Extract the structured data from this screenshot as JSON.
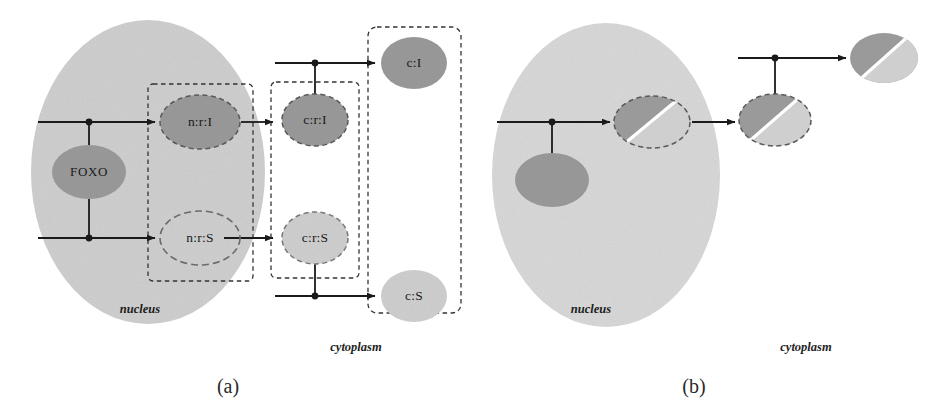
{
  "figure": {
    "panels": [
      {
        "id": "a",
        "caption": "(a)",
        "caption_x": 228,
        "caption_y": 388,
        "compartments": [
          {
            "name": "nucleus",
            "label": "nucleus",
            "label_x": 140,
            "label_y": 310,
            "shape": "ellipse",
            "cx": 148,
            "cy": 172,
            "rx": 117,
            "ry": 152,
            "fill": "#cfcfcf"
          },
          {
            "name": "cytoplasm",
            "label": "cytoplasm",
            "label_x": 356,
            "label_y": 348
          }
        ],
        "groups": [
          {
            "name": "nuclear-receptor-group",
            "x": 148,
            "y": 84,
            "w": 105,
            "h": 197
          },
          {
            "name": "cytoplasmic-receptor-group",
            "x": 271,
            "y": 82,
            "w": 88,
            "h": 196
          },
          {
            "name": "free-ligand-group",
            "x": 368,
            "y": 27,
            "w": 93,
            "h": 286
          }
        ],
        "nodes": [
          {
            "name": "foxo",
            "label": "FOXO",
            "cx": 89,
            "cy": 172,
            "rx": 37,
            "ry": 27,
            "fill": "#9a9a9a",
            "border": "none"
          },
          {
            "name": "n-r-I",
            "label": "n:r:I",
            "cx": 200,
            "cy": 122,
            "rx": 40,
            "ry": 27,
            "fill": "#9a9a9a",
            "border": "dashed"
          },
          {
            "name": "n-r-S",
            "label": "n:r:S",
            "cx": 200,
            "cy": 238,
            "rx": 40,
            "ry": 27,
            "fill": "none",
            "border": "dashed"
          },
          {
            "name": "c-r-I",
            "label": "c:r:I",
            "cx": 315,
            "cy": 120,
            "rx": 33,
            "ry": 26,
            "fill": "#9a9a9a",
            "border": "dashed"
          },
          {
            "name": "c-r-S",
            "label": "c:r:S",
            "cx": 315,
            "cy": 238,
            "rx": 33,
            "ry": 26,
            "fill": "#cfcfcf",
            "border": "dashed"
          },
          {
            "name": "c-I",
            "label": "c:I",
            "cx": 414,
            "cy": 63,
            "rx": 33,
            "ry": 26,
            "fill": "#9a9a9a",
            "border": "none"
          },
          {
            "name": "c-S",
            "label": "c:S",
            "cx": 414,
            "cy": 296,
            "rx": 33,
            "ry": 26,
            "fill": "#cfcfcf",
            "border": "none"
          }
        ],
        "edges": [
          {
            "name": "edge-foxo-to-nrI",
            "type": "tee-arrow"
          },
          {
            "name": "edge-foxo-to-nrS",
            "type": "tee-arrow"
          },
          {
            "name": "edge-nrI-to-crI",
            "type": "arrow"
          },
          {
            "name": "edge-nrS-to-crS",
            "type": "arrow"
          },
          {
            "name": "edge-crI-to-cI",
            "type": "tee-arrow"
          },
          {
            "name": "edge-crS-to-cS",
            "type": "tee-arrow"
          }
        ]
      },
      {
        "id": "b",
        "caption": "(b)",
        "caption_x": 694,
        "caption_y": 388,
        "compartments": [
          {
            "name": "nucleus",
            "label": "nucleus",
            "label_x": 591,
            "label_y": 310,
            "shape": "ellipse",
            "cx": 606,
            "cy": 175,
            "rx": 114,
            "ry": 152,
            "fill": "#d8d8d8"
          },
          {
            "name": "cytoplasm",
            "label": "cytoplasm",
            "label_x": 806,
            "label_y": 348
          }
        ],
        "nodes": [
          {
            "name": "nuclear-foxo",
            "label": "",
            "cx": 552,
            "cy": 180,
            "rx": 37,
            "ry": 27,
            "fill": "#9a9a9a",
            "border": "none",
            "split": false
          },
          {
            "name": "nuclear-complex-split",
            "label": "",
            "cx": 652,
            "cy": 122,
            "rx": 38,
            "ry": 26,
            "fill": "split",
            "border": "dashed",
            "split": true
          },
          {
            "name": "cytoplasmic-complex-split",
            "label": "",
            "cx": 775,
            "cy": 120,
            "rx": 36,
            "ry": 26,
            "fill": "split",
            "border": "dashed",
            "split": true
          },
          {
            "name": "free-ligand-split",
            "label": "",
            "cx": 884,
            "cy": 58,
            "rx": 34,
            "ry": 25,
            "fill": "split",
            "border": "none",
            "split": true
          }
        ],
        "edges": [
          {
            "name": "edge-foxo-to-complex",
            "type": "tee-arrow"
          },
          {
            "name": "edge-complex-to-cytoplasmic",
            "type": "arrow"
          },
          {
            "name": "edge-cytoplasmic-to-free",
            "type": "tee-arrow"
          }
        ]
      }
    ],
    "colors": {
      "nucleus_fill_a": "#cfcfcf",
      "nucleus_fill_b": "#d8d8d8",
      "node_dark": "#9a9a9a",
      "node_light": "#cfcfcf",
      "stroke": "#1a1a1a",
      "dashed_stroke": "#3a3a3a",
      "background": "#ffffff"
    }
  }
}
